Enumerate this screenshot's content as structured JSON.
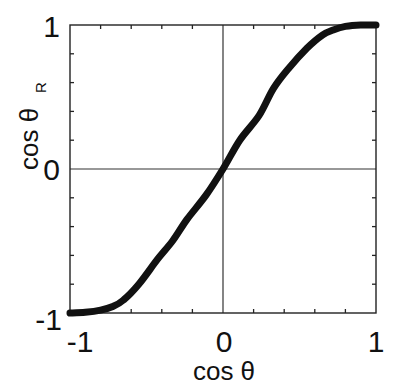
{
  "chart_data": {
    "type": "line",
    "title": "",
    "xlabel": "cos θ",
    "ylabel": "cos θ",
    "ylabel_subscript": "R",
    "xlim": [
      -1,
      1
    ],
    "ylim": [
      -1,
      1
    ],
    "x_ticks_labeled": [
      -1,
      0,
      1
    ],
    "y_ticks_labeled": [
      -1,
      0,
      1
    ],
    "x_tick_labels": [
      "-1",
      "0",
      "1"
    ],
    "y_tick_labels": [
      "-1",
      "0",
      "1"
    ],
    "minor_tick_step": 0.2,
    "grid": false,
    "zero_lines": true,
    "legend": null,
    "series": [
      {
        "name": "cos θ_R vs cos θ",
        "color": "#111111",
        "x": [
          -1.0,
          -0.9,
          -0.8,
          -0.72,
          -0.65,
          -0.55,
          -0.43,
          -0.33,
          -0.235,
          -0.11,
          0.0,
          0.11,
          0.235,
          0.33,
          0.43,
          0.55,
          0.65,
          0.72,
          0.8,
          0.9,
          1.0
        ],
        "y": [
          -1.0,
          -0.995,
          -0.98,
          -0.955,
          -0.91,
          -0.8,
          -0.63,
          -0.5,
          -0.35,
          -0.18,
          0.0,
          0.2,
          0.37,
          0.56,
          0.7,
          0.84,
          0.93,
          0.965,
          0.99,
          1.0,
          1.0
        ]
      }
    ]
  },
  "labels": {
    "x_axis": "cos θ",
    "y_axis": "cos θ",
    "y_axis_sub": "R",
    "x_tick_neg1": "-1",
    "x_tick_0": "0",
    "x_tick_1": "1",
    "y_tick_neg1": "-1",
    "y_tick_0": "0",
    "y_tick_1": "1"
  }
}
